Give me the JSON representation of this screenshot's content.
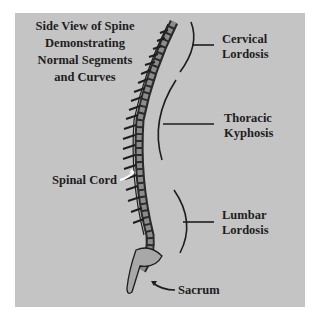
{
  "diagram": {
    "title_lines": [
      "Side View of Spine",
      "Demonstrating",
      "Normal Segments",
      "and Curves"
    ],
    "labels": {
      "cervical": [
        "Cervical",
        "Lordosis"
      ],
      "thoracic": [
        "Thoracic",
        "Kyphosis"
      ],
      "lumbar": [
        "Lumbar",
        "Lordosis"
      ],
      "spinal_cord": "Spinal Cord",
      "sacrum": "Sacrum"
    },
    "colors": {
      "background": "#ffffff",
      "panel": "#c4c4c4",
      "ink": "#1e1e1e",
      "vertebra_fill": "#9a9a9a",
      "pointer_arrow": "#ffffff"
    },
    "segments": [
      {
        "name": "Cervical",
        "curve": "Lordosis"
      },
      {
        "name": "Thoracic",
        "curve": "Kyphosis"
      },
      {
        "name": "Lumbar",
        "curve": "Lordosis"
      },
      {
        "name": "Sacrum",
        "curve": ""
      }
    ]
  }
}
